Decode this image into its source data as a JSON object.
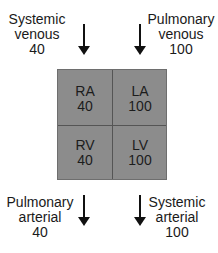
{
  "inflows": [
    {
      "name": "Systemic",
      "sub": "venous",
      "value": "40"
    },
    {
      "name": "Pulmonary",
      "sub": "venous",
      "value": "100"
    }
  ],
  "chambers": [
    {
      "label": "RA",
      "value": "40"
    },
    {
      "label": "LA",
      "value": "100"
    },
    {
      "label": "RV",
      "value": "40"
    },
    {
      "label": "LV",
      "value": "100"
    }
  ],
  "outflows": [
    {
      "name": "Pulmonary",
      "sub": "arterial",
      "value": "40"
    },
    {
      "name": "Systemic",
      "sub": "arterial",
      "value": "100"
    }
  ],
  "colors": {
    "chamber_fill": "#8c8c8c",
    "divider": "#555555",
    "arrow": "#111111"
  }
}
